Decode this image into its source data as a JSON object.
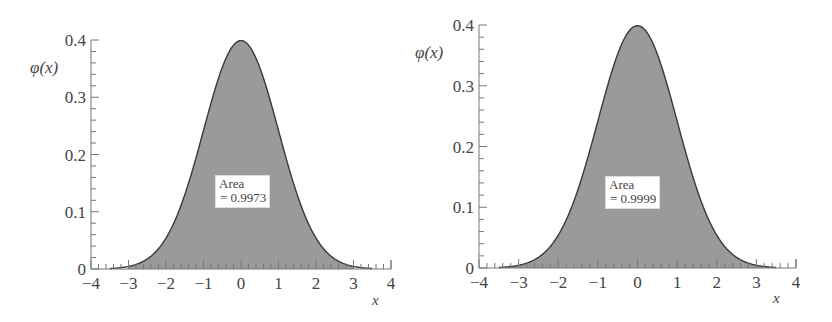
{
  "chart_data": [
    {
      "type": "area",
      "title": "",
      "xlabel": "x",
      "ylabel": "φ(x)",
      "xlim": [
        -4,
        4
      ],
      "ylim": [
        0,
        0.4
      ],
      "x_ticks": [
        -4,
        -3,
        -2,
        -1,
        0,
        1,
        2,
        3,
        4
      ],
      "x_tick_labels": [
        "−4",
        "−3",
        "−2",
        "−1",
        "0",
        "1",
        "2",
        "3",
        "4"
      ],
      "y_ticks": [
        0,
        0.1,
        0.2,
        0.3,
        0.4
      ],
      "y_tick_labels": [
        "0",
        "0.1",
        "0.2",
        "0.3",
        "0.4"
      ],
      "grid": false,
      "curve": "standard normal density φ(x) = (1/√(2π))·e^(−x²/2)",
      "shaded_interval": [
        -3,
        3
      ],
      "annotation": {
        "line1": "Area",
        "line2": "= 0.9973"
      },
      "series": [
        {
          "name": "φ(x)",
          "x": [
            -4,
            -3.5,
            -3,
            -2.5,
            -2,
            -1.5,
            -1,
            -0.5,
            0,
            0.5,
            1,
            1.5,
            2,
            2.5,
            3,
            3.5,
            4
          ],
          "values": [
            0.0001,
            0.0009,
            0.0044,
            0.0175,
            0.054,
            0.1295,
            0.242,
            0.3521,
            0.3989,
            0.3521,
            0.242,
            0.1295,
            0.054,
            0.0175,
            0.0044,
            0.0009,
            0.0001
          ]
        }
      ]
    },
    {
      "type": "area",
      "title": "",
      "xlabel": "x",
      "ylabel": "φ(x)",
      "xlim": [
        -4,
        4
      ],
      "ylim": [
        0,
        0.4
      ],
      "x_ticks": [
        -4,
        -3,
        -2,
        -1,
        0,
        1,
        2,
        3,
        4
      ],
      "x_tick_labels": [
        "−4",
        "−3",
        "−2",
        "−1",
        "0",
        "1",
        "2",
        "3",
        "4"
      ],
      "y_ticks": [
        0,
        0.1,
        0.2,
        0.3,
        0.4
      ],
      "y_tick_labels": [
        "0",
        "0.1",
        "0.2",
        "0.3",
        "0.4"
      ],
      "grid": false,
      "curve": "standard normal density φ(x) = (1/√(2π))·e^(−x²/2)",
      "shaded_interval": [
        -3.5,
        3.5
      ],
      "annotation": {
        "line1": "Area",
        "line2": "= 0.9999"
      },
      "series": [
        {
          "name": "φ(x)",
          "x": [
            -4,
            -3.5,
            -3,
            -2.5,
            -2,
            -1.5,
            -1,
            -0.5,
            0,
            0.5,
            1,
            1.5,
            2,
            2.5,
            3,
            3.5,
            4
          ],
          "values": [
            0.0001,
            0.0009,
            0.0044,
            0.0175,
            0.054,
            0.1295,
            0.242,
            0.3521,
            0.3989,
            0.3521,
            0.242,
            0.1295,
            0.054,
            0.0175,
            0.0044,
            0.0009,
            0.0001
          ]
        }
      ]
    }
  ],
  "layout": {
    "panels": [
      {
        "x0": 91,
        "x1": 391,
        "y_top": 40,
        "y_bot": 269,
        "ylabel_x": 30,
        "ylabel_y": 73,
        "xlabel_x": 372,
        "xlabel_y": 305,
        "box_left": 215,
        "box_top": 175
      },
      {
        "x0": 479,
        "x1": 796,
        "y_top": 25,
        "y_bot": 268,
        "ylabel_x": 415,
        "ylabel_y": 58,
        "xlabel_x": 773,
        "xlabel_y": 303,
        "box_left": 605,
        "box_top": 176
      }
    ],
    "fill_color": "#9a9a9a",
    "curve_color": "#3a3a3a",
    "axis_color": "#777777"
  }
}
